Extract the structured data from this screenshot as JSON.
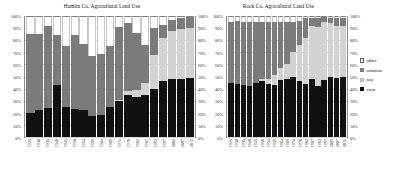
{
  "legend": {
    "position": "right",
    "items": [
      {
        "label": "other",
        "color": "#ffffff",
        "key": "other"
      },
      {
        "label": "rotation",
        "color": "#7b7b7b",
        "key": "rotation"
      },
      {
        "label": "soy",
        "color": "#d2d2d2",
        "key": "soy"
      },
      {
        "label": "corn",
        "color": "#111111",
        "key": "corn"
      }
    ]
  },
  "yticks": [
    "100%",
    "90%",
    "80%",
    "70%",
    "60%",
    "50%",
    "40%",
    "30%",
    "20%",
    "10%",
    "0%"
  ],
  "chart_data": [
    {
      "type": "bar",
      "stacked": true,
      "title": "Hamlin Co. Agricultural Land Use",
      "xlabel": "",
      "ylabel": "",
      "ylim": [
        0,
        100
      ],
      "grid": false,
      "legend_position": "right",
      "categories": [
        "1925",
        "1930",
        "1935",
        "1940",
        "1945",
        "1950",
        "1954",
        "1959",
        "1964",
        "1969",
        "1974",
        "1978",
        "1982",
        "1987",
        "1992",
        "1997",
        "2002",
        "2007",
        "2012"
      ],
      "series": [
        {
          "name": "corn",
          "color": "#111111",
          "values": [
            20,
            22,
            24,
            43,
            25,
            23,
            22,
            17,
            18,
            25,
            30,
            35,
            33,
            35,
            40,
            46,
            48,
            48,
            49
          ]
        },
        {
          "name": "soy",
          "color": "#d2d2d2",
          "values": [
            0,
            0,
            0,
            0,
            0,
            0,
            0,
            0,
            0,
            0,
            1,
            3,
            6,
            10,
            28,
            36,
            40,
            41,
            41
          ]
        },
        {
          "name": "rotation",
          "color": "#7b7b7b",
          "values": [
            65,
            63,
            68,
            41,
            50,
            61,
            55,
            50,
            51,
            50,
            60,
            56,
            47,
            31,
            22,
            11,
            9,
            9,
            9
          ]
        },
        {
          "name": "other",
          "color": "#ffffff",
          "values": [
            15,
            15,
            8,
            16,
            25,
            16,
            23,
            33,
            31,
            25,
            9,
            6,
            14,
            24,
            10,
            7,
            3,
            2,
            1
          ]
        }
      ]
    },
    {
      "type": "bar",
      "stacked": true,
      "title": "Rock Co. Agricultural Land Use",
      "xlabel": "",
      "ylabel": "",
      "ylim": [
        0,
        100
      ],
      "grid": false,
      "legend_position": "right",
      "categories": [
        "1925",
        "1930",
        "1935",
        "1940",
        "1945",
        "1950",
        "1954",
        "1959",
        "1964",
        "1969",
        "1974",
        "1978",
        "1982",
        "1987",
        "1992",
        "1997",
        "2002",
        "2007",
        "2012"
      ],
      "series": [
        {
          "name": "corn",
          "color": "#111111",
          "values": [
            45,
            44,
            43,
            42,
            45,
            46,
            44,
            43,
            47,
            48,
            50,
            46,
            44,
            48,
            42,
            47,
            50,
            49,
            50
          ]
        },
        {
          "name": "soy",
          "color": "#d2d2d2",
          "values": [
            0,
            0,
            0,
            0,
            0,
            2,
            4,
            8,
            10,
            12,
            20,
            30,
            38,
            44,
            49,
            48,
            44,
            43,
            42
          ]
        },
        {
          "name": "rotation",
          "color": "#7b7b7b",
          "values": [
            50,
            52,
            52,
            53,
            50,
            47,
            47,
            44,
            38,
            35,
            25,
            20,
            16,
            6,
            7,
            4,
            4,
            6,
            6
          ]
        },
        {
          "name": "other",
          "color": "#ffffff",
          "values": [
            5,
            4,
            5,
            5,
            5,
            5,
            5,
            5,
            5,
            5,
            5,
            4,
            2,
            2,
            2,
            1,
            2,
            2,
            2
          ]
        }
      ]
    }
  ]
}
